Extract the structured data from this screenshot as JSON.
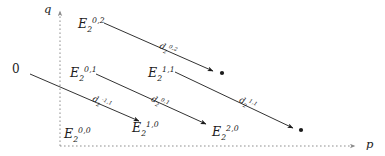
{
  "figure": {
    "kind": "spectral-sequence-E2-page",
    "background_color": "#ffffff",
    "ink_color": "#1b1b1b",
    "axis_color": "#8c8c8c",
    "top_artifact_text": "",
    "axes": {
      "x_label": "p",
      "y_label": "q",
      "origin_label": "0",
      "x_axis_style": "dashed",
      "y_axis_style": "dashed"
    },
    "terms": [
      {
        "id": "E2-0-2",
        "base": "E",
        "sub": "2",
        "sup": "0,2",
        "x": 78,
        "y": 18
      },
      {
        "id": "E2-0-1",
        "base": "E",
        "sub": "2",
        "sup": "0,1",
        "x": 70,
        "y": 67
      },
      {
        "id": "E2-1-1",
        "base": "E",
        "sub": "2",
        "sup": "1,1",
        "x": 148,
        "y": 67
      },
      {
        "id": "E2-0-0",
        "base": "E",
        "sub": "2",
        "sup": "0,0",
        "x": 64,
        "y": 128
      },
      {
        "id": "E2-1-0",
        "base": "E",
        "sub": "2",
        "sup": "1,0",
        "x": 132,
        "y": 122
      },
      {
        "id": "E2-2-0",
        "base": "E",
        "sub": "2",
        "sup": "2,0",
        "x": 212,
        "y": 126
      }
    ],
    "differentials": [
      {
        "id": "d2-0-2",
        "base": "d",
        "sub": "2",
        "sup": "0,2",
        "label_x": 160,
        "label_y": 41,
        "x1": 104,
        "y1": 23,
        "x2": 213,
        "y2": 71,
        "has_target_dot": true,
        "dot_x": 222,
        "dot_y": 73
      },
      {
        "id": "d2-minus1-1",
        "base": "d",
        "sub": "2",
        "sup": "-1,1",
        "label_x": 93,
        "label_y": 94,
        "x1": 30,
        "y1": 74,
        "x2": 139,
        "y2": 121,
        "has_target_dot": false
      },
      {
        "id": "d2-0-1",
        "base": "d",
        "sub": "2",
        "sup": "0,1",
        "label_x": 152,
        "label_y": 94,
        "x1": 96,
        "y1": 74,
        "x2": 206,
        "y2": 124,
        "has_target_dot": false
      },
      {
        "id": "d2-1-1",
        "base": "d",
        "sub": "2",
        "sup": "1,1",
        "label_x": 240,
        "label_y": 95,
        "x1": 175,
        "y1": 72,
        "x2": 293,
        "y2": 128,
        "has_target_dot": true,
        "dot_x": 301,
        "dot_y": 130
      }
    ]
  }
}
